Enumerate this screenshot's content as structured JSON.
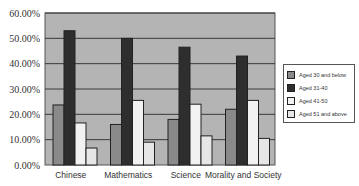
{
  "chart_data": {
    "type": "bar",
    "title": "",
    "xlabel": "",
    "ylabel": "",
    "ylim": [
      0,
      60
    ],
    "y_ticks": [
      "0.00%",
      "10.00%",
      "20.00%",
      "30.00%",
      "40.00%",
      "50.00%",
      "60.00%"
    ],
    "grid": true,
    "legend_position": "right",
    "categories": [
      "Chinese",
      "Mathematics",
      "Science",
      "Morality and Society"
    ],
    "series": [
      {
        "name": "Aged 30 and below",
        "color": "#8a8a8a",
        "values": [
          23.7,
          16.0,
          18.0,
          22.0
        ]
      },
      {
        "name": "Aged 31-40",
        "color": "#2e2e2e",
        "values": [
          53.0,
          50.0,
          46.5,
          43.0
        ]
      },
      {
        "name": "Aged 41-50",
        "color": "#f2f2f2",
        "values": [
          16.6,
          25.5,
          24.0,
          25.5
        ]
      },
      {
        "name": "Aged 51 and above",
        "color": "#e6e6e6",
        "values": [
          6.7,
          9.0,
          11.5,
          10.5
        ]
      }
    ]
  },
  "colors": {
    "plot_background": "#b4b4b4",
    "gridline": "#3a3a3a",
    "bar_outline": "#222222"
  }
}
